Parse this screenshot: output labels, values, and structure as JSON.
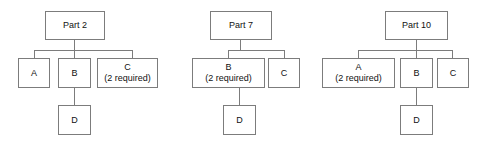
{
  "diagram": {
    "line_color": "#7c7c7c",
    "box_fill": "#ffffff",
    "text_color": "#111111"
  },
  "trees": [
    {
      "name": "tree-part-2",
      "root": {
        "label": "Part 2",
        "sub": ""
      },
      "children": [
        {
          "label": "A",
          "sub": ""
        },
        {
          "label": "B",
          "sub": ""
        },
        {
          "label": "C",
          "sub": "(2 required)"
        }
      ],
      "grandchild": {
        "label": "D",
        "sub": "",
        "parent": "B"
      }
    },
    {
      "name": "tree-part-7",
      "root": {
        "label": "Part 7",
        "sub": ""
      },
      "children": [
        {
          "label": "B",
          "sub": "(2 required)"
        },
        {
          "label": "C",
          "sub": ""
        }
      ],
      "grandchild": {
        "label": "D",
        "sub": "",
        "parent": "B"
      }
    },
    {
      "name": "tree-part-10",
      "root": {
        "label": "Part 10",
        "sub": ""
      },
      "children": [
        {
          "label": "A",
          "sub": "(2 required)"
        },
        {
          "label": "B",
          "sub": ""
        },
        {
          "label": "C",
          "sub": ""
        }
      ],
      "grandchild": {
        "label": "D",
        "sub": "",
        "parent": "B"
      }
    }
  ]
}
